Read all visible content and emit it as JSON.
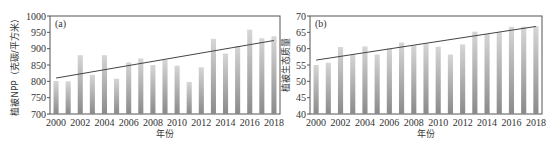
{
  "chart_data": [
    {
      "id": "a",
      "type": "bar",
      "panel_label": "(a)",
      "title": "",
      "xlabel": "年份",
      "ylabel": "植被NPP（克碳/平方米）",
      "ylim": [
        700,
        1000
      ],
      "yticks": [
        700,
        750,
        800,
        850,
        900,
        950,
        1000
      ],
      "xtick_labels": [
        "2000",
        "2002",
        "2004",
        "2006",
        "2008",
        "2010",
        "2012",
        "2014",
        "2016",
        "2018"
      ],
      "categories": [
        "2000",
        "2001",
        "2002",
        "2003",
        "2004",
        "2005",
        "2006",
        "2007",
        "2008",
        "2009",
        "2010",
        "2011",
        "2012",
        "2013",
        "2014",
        "2015",
        "2016",
        "2017",
        "2018"
      ],
      "values": [
        801,
        800,
        880,
        820,
        880,
        808,
        858,
        870,
        850,
        866,
        848,
        798,
        843,
        930,
        885,
        908,
        958,
        932,
        938
      ],
      "trendline": {
        "start": 810,
        "end": 925
      },
      "grid": false,
      "legend": null
    },
    {
      "id": "b",
      "type": "bar",
      "panel_label": "(b)",
      "title": "",
      "xlabel": "年份",
      "ylabel": "植被生态质量",
      "ylim": [
        40,
        70
      ],
      "yticks": [
        40,
        45,
        50,
        55,
        60,
        65,
        70
      ],
      "xtick_labels": [
        "2000",
        "2002",
        "2004",
        "2006",
        "2008",
        "2010",
        "2012",
        "2014",
        "2016",
        "2018"
      ],
      "categories": [
        "2000",
        "2001",
        "2002",
        "2003",
        "2004",
        "2005",
        "2006",
        "2007",
        "2008",
        "2009",
        "2010",
        "2011",
        "2012",
        "2013",
        "2014",
        "2015",
        "2016",
        "2017",
        "2018"
      ],
      "values": [
        55.0,
        55.7,
        60.5,
        58.2,
        60.7,
        58.2,
        60.0,
        61.9,
        61.0,
        61.6,
        60.6,
        58.2,
        61.3,
        65.2,
        64.5,
        65.0,
        66.7,
        66.7,
        66.9
      ],
      "trendline": {
        "start": 56.5,
        "end": 66.8
      },
      "grid": false,
      "legend": null
    }
  ],
  "colors": {
    "bar_top": "#d6d6d6",
    "bar_bottom": "#8a8a8a",
    "trendline": "#444444",
    "frame": "#555555"
  }
}
